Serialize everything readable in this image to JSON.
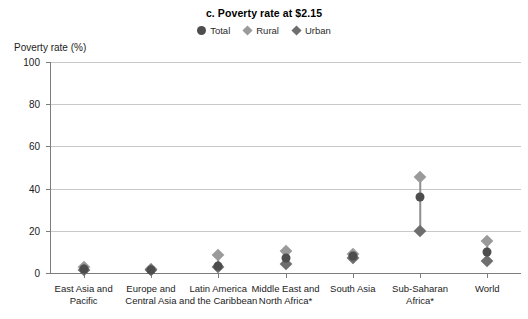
{
  "chart_data": {
    "type": "scatter",
    "title": "c. Poverty rate at $2.15",
    "xlabel": "",
    "ylabel": "Poverty rate (%)",
    "ylim": [
      0,
      100
    ],
    "yticks": [
      0,
      20,
      40,
      60,
      80,
      100
    ],
    "grid": true,
    "legend_position": "top-center",
    "categories": [
      "East Asia and Pacific",
      "Europe and Central Asia",
      "Latin America and the Caribbean",
      "Middle East and North Africa*",
      "South Asia",
      "Sub-Saharan Africa*",
      "World"
    ],
    "category_lines": [
      [
        "East Asia and",
        "Pacific"
      ],
      [
        "Europe and",
        "Central Asia"
      ],
      [
        "Latin America",
        "and the Caribbean"
      ],
      [
        "Middle East and",
        "North Africa*"
      ],
      [
        "South Asia",
        ""
      ],
      [
        "Sub-Saharan",
        "Africa*"
      ],
      [
        "World",
        ""
      ]
    ],
    "series": [
      {
        "name": "Total",
        "marker": "circle",
        "color": "#4d4d4d",
        "values": [
          2.0,
          1.5,
          3.5,
          7.0,
          8.2,
          36.0,
          9.8
        ]
      },
      {
        "name": "Rural",
        "marker": "diamond",
        "color": "#9a9a9a",
        "values": [
          3.0,
          1.8,
          8.5,
          10.5,
          9.0,
          45.5,
          15.0
        ]
      },
      {
        "name": "Urban",
        "marker": "diamond",
        "color": "#6e6e6e",
        "values": [
          1.2,
          1.2,
          3.0,
          4.2,
          7.0,
          20.0,
          5.5
        ]
      }
    ]
  },
  "legend": {
    "items": [
      {
        "label": "Total",
        "marker": "circle",
        "color": "#4d4d4d"
      },
      {
        "label": "Rural",
        "marker": "diamond",
        "color": "#9a9a9a"
      },
      {
        "label": "Urban",
        "marker": "diamond",
        "color": "#6e6e6e"
      }
    ]
  },
  "colors": {
    "total": "#4d4d4d",
    "rural": "#9a9a9a",
    "urban": "#6e6e6e",
    "gridline": "#c9c9c9",
    "axis": "#7d7d7d",
    "connector": "#8e8e8e",
    "text": "#1c1c1c"
  }
}
